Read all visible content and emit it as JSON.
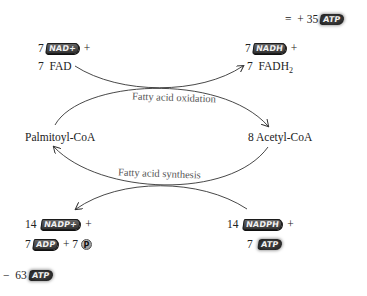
{
  "diagram": {
    "net_oxidation": {
      "sign": "=",
      "op": "+",
      "count": "35",
      "molecule": "ATP"
    },
    "oxidation_inputs": [
      {
        "coef": "7",
        "molecule": "NAD+",
        "suffix": "+"
      },
      {
        "coef": "7",
        "text": "FAD"
      }
    ],
    "oxidation_outputs": [
      {
        "coef": "7",
        "molecule": "NADH",
        "suffix": "+"
      },
      {
        "coef": "7",
        "text": "FADH",
        "sub": "2"
      }
    ],
    "left_node": "Palmitoyl-CoA",
    "right_node": "8 Acetyl-CoA",
    "oxidation_label": "Fatty acid oxidation",
    "synthesis_label": "Fatty acid synthesis",
    "synthesis_outputs": [
      {
        "coef": "14",
        "molecule": "NADP+",
        "suffix": "+"
      },
      {
        "coef": "7",
        "molecule": "ADP",
        "op": "+",
        "coef2": "7",
        "pi": "P"
      }
    ],
    "synthesis_inputs": [
      {
        "coef": "14",
        "molecule": "NADPH",
        "suffix": "+"
      },
      {
        "coef": "7",
        "molecule": "ATP"
      }
    ],
    "net_synthesis": {
      "sign": "−",
      "count": "63",
      "molecule": "ATP"
    }
  },
  "colors": {
    "text": "#222222",
    "label": "#555555",
    "arrow": "#333333",
    "box": "#2d2d2d"
  }
}
